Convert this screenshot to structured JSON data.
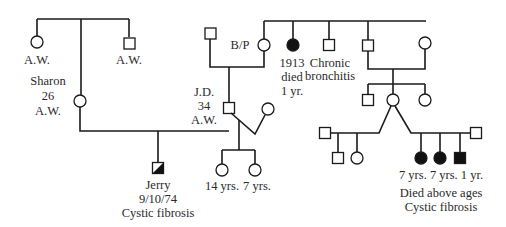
{
  "diagram": {
    "type": "pedigree",
    "colors": {
      "line": "#1a1a1a",
      "affected": "#111111",
      "unaffected": "#ffffff",
      "text": "#2a2a2a"
    },
    "individuals": [
      {
        "id": "gm-left-sister",
        "sex": "female",
        "status": "unaffected",
        "x": 37,
        "y": 42,
        "label_lines": [
          "A.W."
        ]
      },
      {
        "id": "gm-left-brother",
        "sex": "male",
        "status": "unaffected",
        "x": 129,
        "y": 43,
        "label_lines": [
          "A.W."
        ]
      },
      {
        "id": "sharon",
        "sex": "female",
        "status": "unaffected",
        "x": 80,
        "y": 101,
        "label_lines": [
          "Sharon",
          "26",
          "A.W."
        ]
      },
      {
        "id": "jd-father",
        "sex": "male",
        "status": "unaffected",
        "x": 210,
        "y": 33,
        "label_lines": []
      },
      {
        "id": "b-p",
        "sex": "female",
        "status": "unaffected",
        "x": 264,
        "y": 45,
        "label_lines": [
          "B/P"
        ]
      },
      {
        "id": "sister-1913",
        "sex": "female",
        "status": "affected",
        "x": 293,
        "y": 45,
        "label_lines": [
          "1913",
          "died",
          "1 yr."
        ]
      },
      {
        "id": "brother-bronchitis",
        "sex": "male",
        "status": "unaffected",
        "x": 329,
        "y": 45,
        "label_lines": [
          "Chronic",
          "bronchitis"
        ]
      },
      {
        "id": "brother-right",
        "sex": "male",
        "status": "unaffected",
        "x": 368,
        "y": 45,
        "label_lines": []
      },
      {
        "id": "brother-right-wife",
        "sex": "female",
        "status": "unaffected",
        "x": 425,
        "y": 43,
        "label_lines": []
      },
      {
        "id": "jd",
        "sex": "male",
        "status": "unaffected",
        "x": 229,
        "y": 108,
        "label_lines": [
          "J.D.",
          "34",
          "A.W."
        ]
      },
      {
        "id": "jd-wife",
        "sex": "female",
        "status": "unaffected",
        "x": 268,
        "y": 109,
        "label_lines": []
      },
      {
        "id": "cousin-male",
        "sex": "male",
        "status": "unaffected",
        "x": 368,
        "y": 100,
        "label_lines": []
      },
      {
        "id": "cousin-female",
        "sex": "female",
        "status": "unaffected",
        "x": 393,
        "y": 100,
        "label_lines": []
      },
      {
        "id": "cousin-female-2",
        "sex": "female",
        "status": "unaffected",
        "x": 425,
        "y": 100,
        "label_lines": []
      },
      {
        "id": "cousin-husband-1",
        "sex": "male",
        "status": "unaffected",
        "x": 325,
        "y": 133,
        "label_lines": []
      },
      {
        "id": "cousin-husband-2",
        "sex": "male",
        "status": "unaffected",
        "x": 476,
        "y": 133,
        "label_lines": []
      },
      {
        "id": "jerry",
        "sex": "male",
        "status": "carrier-half",
        "x": 158,
        "y": 168,
        "label_lines": [
          "Jerry",
          "9/10/74",
          "Cystic fibrosis"
        ]
      },
      {
        "id": "daughter-14",
        "sex": "female",
        "status": "unaffected",
        "x": 222,
        "y": 170,
        "label_lines": [
          "14 yrs."
        ]
      },
      {
        "id": "daughter-7",
        "sex": "female",
        "status": "unaffected",
        "x": 255,
        "y": 170,
        "label_lines": [
          "7 yrs."
        ]
      },
      {
        "id": "half1-son",
        "sex": "male",
        "status": "unaffected",
        "x": 338,
        "y": 158,
        "label_lines": []
      },
      {
        "id": "half1-daughter",
        "sex": "female",
        "status": "unaffected",
        "x": 357,
        "y": 158,
        "label_lines": []
      },
      {
        "id": "cf-daughter-1",
        "sex": "female",
        "status": "affected",
        "x": 421,
        "y": 158,
        "label_lines": [
          "7 yrs."
        ]
      },
      {
        "id": "cf-daughter-2",
        "sex": "female",
        "status": "affected",
        "x": 440,
        "y": 158,
        "label_lines": [
          "7 yrs."
        ]
      },
      {
        "id": "cf-son",
        "sex": "male",
        "status": "affected",
        "x": 460,
        "y": 158,
        "label_lines": [
          "1 yr."
        ]
      }
    ],
    "annotations": {
      "left_aw": "A.W.",
      "right_aw": "A.W.",
      "sharon_name": "Sharon",
      "sharon_age": "26",
      "sharon_status": "A.W.",
      "bp": "B/P",
      "died_year": "1913",
      "died_word": "died",
      "died_age": "1 yr.",
      "bronchitis_1": "Chronic",
      "bronchitis_2": "bronchitis",
      "jd_name": "J.D.",
      "jd_age": "34",
      "jd_status": "A.W.",
      "jerry_name": "Jerry",
      "jerry_date": "9/10/74",
      "jerry_dx": "Cystic fibrosis",
      "age_14": "14 yrs.",
      "age_7": "7 yrs.",
      "cf_ages": "7 yrs. 7 yrs. 1 yr.",
      "cf_note_1": "Died above ages",
      "cf_note_2": "Cystic fibrosis"
    }
  }
}
